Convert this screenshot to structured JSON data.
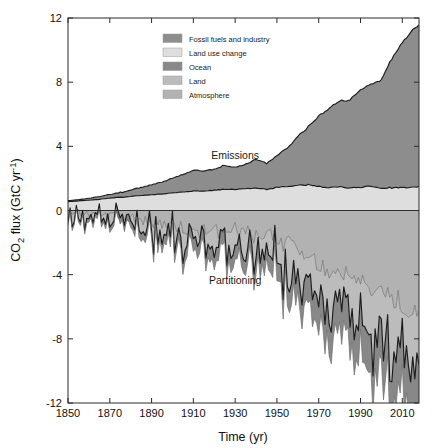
{
  "chart_data": {
    "type": "area",
    "title": "",
    "xlabel": "Time (yr)",
    "ylabel": "CO2 flux (GtC yr-1)",
    "ylabel_parts": {
      "pre": "CO",
      "sub": "2",
      "mid": " flux (GtC yr",
      "sup": "-1",
      "post": ")"
    },
    "xlim": [
      1850,
      2018
    ],
    "ylim": [
      -12,
      12
    ],
    "xticks": [
      1850,
      1870,
      1890,
      1910,
      1930,
      1950,
      1970,
      1990,
      2010
    ],
    "xticklabels": [
      "1850",
      "1870",
      "1890",
      "1910",
      "1930",
      "1950",
      "1970",
      "1990",
      "2010"
    ],
    "yticks": [
      -12,
      -8,
      -4,
      0,
      4,
      8,
      12
    ],
    "yticklabels": [
      "-12",
      "-8",
      "-4",
      "0",
      "4",
      "8",
      "12"
    ],
    "grid": false,
    "legend_position": "upper-center-left",
    "annotations": [
      {
        "text": "Emissions",
        "x": 1930,
        "y": 3.2
      },
      {
        "text": "Partitioning",
        "x": 1930,
        "y": -4.6
      }
    ],
    "legend": [
      {
        "label": "Fossil fuels and industry",
        "color": "#8d8d8d"
      },
      {
        "label": "Land use change",
        "color": "#dedede"
      },
      {
        "label": "Ocean",
        "color": "#888888"
      },
      {
        "label": "Land",
        "color": "#bcbcbc"
      },
      {
        "label": "Atmosphere",
        "color": "#b2b2b2"
      }
    ],
    "x": [
      1850,
      1855,
      1860,
      1865,
      1870,
      1875,
      1880,
      1885,
      1890,
      1895,
      1900,
      1905,
      1910,
      1915,
      1920,
      1925,
      1930,
      1935,
      1940,
      1945,
      1950,
      1955,
      1960,
      1965,
      1970,
      1975,
      1980,
      1985,
      1990,
      1995,
      2000,
      2005,
      2010,
      2015,
      2018
    ],
    "series": [
      {
        "name": "Land use change",
        "stack": "emissions",
        "color": "#dedede",
        "values": [
          0.55,
          0.6,
          0.64,
          0.7,
          0.78,
          0.82,
          0.88,
          0.93,
          0.98,
          1.03,
          1.1,
          1.16,
          1.22,
          1.22,
          1.26,
          1.32,
          1.32,
          1.36,
          1.4,
          1.32,
          1.44,
          1.5,
          1.56,
          1.6,
          1.5,
          1.42,
          1.48,
          1.42,
          1.46,
          1.52,
          1.4,
          1.42,
          1.44,
          1.44,
          1.5
        ]
      },
      {
        "name": "Fossil fuels and industry",
        "stack": "emissions",
        "color": "#8d8d8d",
        "values": [
          0.05,
          0.08,
          0.12,
          0.17,
          0.23,
          0.3,
          0.4,
          0.5,
          0.62,
          0.74,
          0.92,
          1.08,
          1.28,
          1.26,
          1.32,
          1.48,
          1.38,
          1.52,
          1.8,
          1.62,
          1.95,
          2.4,
          3.05,
          3.6,
          4.4,
          4.95,
          5.35,
          5.5,
          6.1,
          6.35,
          6.75,
          8.05,
          9.05,
          9.8,
          10.1
        ]
      },
      {
        "name": "Atmosphere",
        "stack": "partitioning",
        "color": "#b2b2b2",
        "values": [
          -0.15,
          -0.18,
          -0.22,
          -0.28,
          -0.34,
          -0.4,
          -0.48,
          -0.56,
          -0.66,
          -0.76,
          -0.9,
          -1.02,
          -1.16,
          -1.14,
          -1.22,
          -1.34,
          -1.28,
          -1.38,
          -1.58,
          -1.42,
          -1.7,
          -2.05,
          -2.55,
          -2.95,
          -3.5,
          -3.85,
          -4.1,
          -4.2,
          -4.55,
          -4.7,
          -4.95,
          -5.6,
          -6.1,
          -6.45,
          -6.6
        ]
      },
      {
        "name": "Land",
        "stack": "partitioning",
        "color": "#bcbcbc",
        "values": [
          -0.22,
          -0.25,
          -0.2,
          -0.34,
          -0.3,
          -0.44,
          -0.36,
          -0.52,
          -0.45,
          -0.6,
          -0.52,
          -0.7,
          -0.6,
          -0.95,
          -0.7,
          -1.05,
          -0.8,
          -1.25,
          -0.95,
          -1.55,
          -1.05,
          -1.8,
          -1.35,
          -2.2,
          -1.5,
          -2.7,
          -1.75,
          -3.1,
          -2.05,
          -3.45,
          -2.3,
          -3.9,
          -2.55,
          -4.3,
          -3.1
        ]
      },
      {
        "name": "Ocean",
        "stack": "partitioning",
        "color": "#888888",
        "values": [
          -0.2,
          -0.22,
          -0.25,
          -0.28,
          -0.32,
          -0.36,
          -0.4,
          -0.45,
          -0.5,
          -0.56,
          -0.62,
          -0.68,
          -0.75,
          -0.76,
          -0.8,
          -0.86,
          -0.85,
          -0.9,
          -1.0,
          -0.95,
          -1.08,
          -1.22,
          -1.4,
          -1.58,
          -1.78,
          -1.92,
          -2.05,
          -2.1,
          -2.25,
          -2.35,
          -2.45,
          -2.7,
          -2.85,
          -3.0,
          -3.05
        ]
      }
    ],
    "emissions_total_2018": 11.6,
    "partitioning_total_2018": -11.5
  }
}
